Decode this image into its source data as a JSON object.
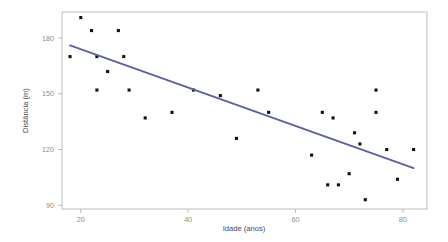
{
  "chart_data": {
    "type": "scatter",
    "title": "",
    "xlabel": "Idade (anos)",
    "ylabel": "Distância (m)",
    "xlim": [
      16.5,
      84.5
    ],
    "ylim": [
      88,
      194
    ],
    "xticks": [
      20,
      40,
      60,
      80
    ],
    "yticks": [
      90,
      120,
      150,
      180
    ],
    "xtick_labels": [
      "20",
      "40",
      "60",
      "80"
    ],
    "ytick_labels": [
      "90",
      "120",
      "150",
      "180"
    ],
    "grid": false,
    "legend": null,
    "series": [
      {
        "name": "observações",
        "marker": "filled-square",
        "color": "#111111",
        "points": [
          {
            "x": 18,
            "y": 170
          },
          {
            "x": 20,
            "y": 191
          },
          {
            "x": 22,
            "y": 184
          },
          {
            "x": 23,
            "y": 170
          },
          {
            "x": 23,
            "y": 152
          },
          {
            "x": 25,
            "y": 162
          },
          {
            "x": 27,
            "y": 184
          },
          {
            "x": 28,
            "y": 170
          },
          {
            "x": 29,
            "y": 152
          },
          {
            "x": 32,
            "y": 137
          },
          {
            "x": 37,
            "y": 140
          },
          {
            "x": 41,
            "y": 152
          },
          {
            "x": 46,
            "y": 149
          },
          {
            "x": 49,
            "y": 126
          },
          {
            "x": 53,
            "y": 152
          },
          {
            "x": 55,
            "y": 140
          },
          {
            "x": 63,
            "y": 117
          },
          {
            "x": 65,
            "y": 140
          },
          {
            "x": 66,
            "y": 101
          },
          {
            "x": 67,
            "y": 137
          },
          {
            "x": 68,
            "y": 101
          },
          {
            "x": 70,
            "y": 107
          },
          {
            "x": 71,
            "y": 129
          },
          {
            "x": 72,
            "y": 123
          },
          {
            "x": 73,
            "y": 93
          },
          {
            "x": 75,
            "y": 140
          },
          {
            "x": 75,
            "y": 152
          },
          {
            "x": 77,
            "y": 120
          },
          {
            "x": 79,
            "y": 104
          },
          {
            "x": 82,
            "y": 120
          }
        ]
      }
    ],
    "trendline": {
      "name": "regressão linear",
      "color": "#5c629c",
      "x_start": 18,
      "y_start": 176,
      "x_end": 82,
      "y_end": 110
    }
  }
}
